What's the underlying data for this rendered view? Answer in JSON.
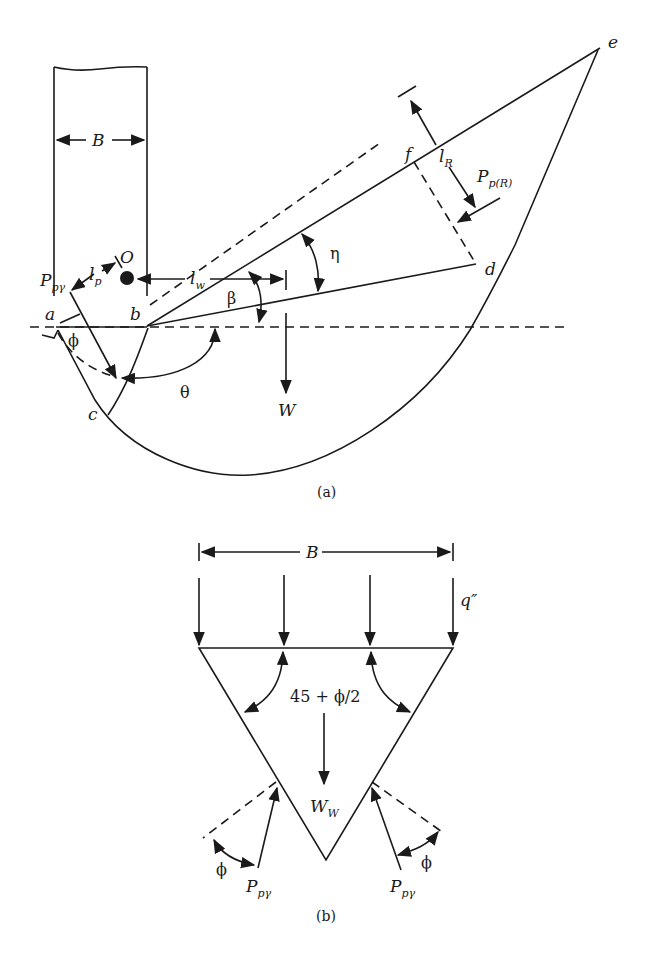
{
  "figure": {
    "panel_a": {
      "caption": "(a)",
      "labels": {
        "width": "B",
        "point_a": "a",
        "point_b": "b",
        "point_c": "c",
        "point_d": "d",
        "point_e": "e",
        "point_f": "f",
        "center": "O",
        "passive_force": "P",
        "passive_force_sub": "pγ",
        "lever_p": "l",
        "lever_p_sub": "p",
        "lever_w": "l",
        "lever_w_sub": "w",
        "lever_r": "l",
        "lever_r_sub": "R",
        "passive_force_r": "P",
        "passive_force_r_sub": "p(R)",
        "weight": "W",
        "angle_phi": "ϕ",
        "angle_theta": "θ",
        "angle_beta": "β",
        "angle_eta": "η"
      }
    },
    "panel_b": {
      "caption": "(b)",
      "labels": {
        "width": "B",
        "surcharge": "q″",
        "wedge_angle": "45 + ϕ/2",
        "wedge_weight": "W",
        "wedge_weight_sub": "W",
        "passive_force_left": "P",
        "passive_force_left_sub": "pγ",
        "passive_force_right": "P",
        "passive_force_right_sub": "pγ",
        "angle_phi_left": "ϕ",
        "angle_phi_right": "ϕ"
      }
    }
  }
}
